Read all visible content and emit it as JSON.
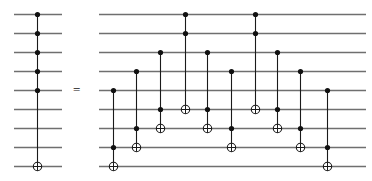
{
  "figure": {
    "kind": "quantum-circuit-identity",
    "equals_symbol": "=",
    "wire_count": 9,
    "wire_color": "#6f6f6f",
    "gate_line_color": "#1a1a1a",
    "dot_color": "#111111",
    "target_fill": "#ffffff",
    "canvas": {
      "width": 372,
      "height": 181
    },
    "wire_y": [
      14,
      33,
      52,
      71,
      90,
      109,
      128,
      147,
      166
    ]
  },
  "left_circuit": {
    "name": "multi-controlled-not",
    "x_start": 14,
    "x_end": 62,
    "equals_x": 73,
    "equals_y": 83,
    "columns": [
      {
        "name": "c5-not",
        "x": 37,
        "controls": [
          1,
          2,
          3,
          4,
          5
        ],
        "targets": [
          9
        ]
      }
    ]
  },
  "right_circuit": {
    "name": "toffoli-ladder-decomposition",
    "x_start": 99,
    "x_end": 366,
    "columns": [
      {
        "name": "toffoli-1",
        "x": 113,
        "controls": [
          5,
          8
        ],
        "targets": [
          9
        ]
      },
      {
        "name": "toffoli-2",
        "x": 136,
        "controls": [
          4,
          7
        ],
        "targets": [
          8
        ]
      },
      {
        "name": "toffoli-3",
        "x": 160,
        "controls": [
          3,
          6
        ],
        "targets": [
          7
        ]
      },
      {
        "name": "toffoli-4",
        "x": 185,
        "controls": [
          1,
          2
        ],
        "targets": [
          6
        ]
      },
      {
        "name": "toffoli-5",
        "x": 207,
        "controls": [
          3,
          6
        ],
        "targets": [
          7
        ]
      },
      {
        "name": "toffoli-6",
        "x": 231,
        "controls": [
          4,
          7
        ],
        "targets": [
          8
        ]
      },
      {
        "name": "toffoli-7",
        "x": 255,
        "controls": [
          1,
          2
        ],
        "targets": [
          6
        ]
      },
      {
        "name": "toffoli-8",
        "x": 277,
        "controls": [
          3,
          6
        ],
        "targets": [
          7
        ]
      },
      {
        "name": "toffoli-9",
        "x": 300,
        "controls": [
          4,
          7
        ],
        "targets": [
          8
        ]
      },
      {
        "name": "toffoli-10",
        "x": 327,
        "controls": [
          5,
          8
        ],
        "targets": [
          9
        ]
      }
    ]
  }
}
